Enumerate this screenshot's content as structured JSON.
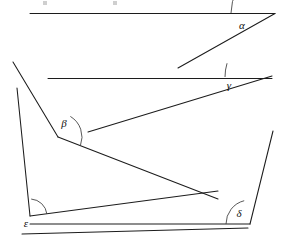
{
  "figure": {
    "width": 286,
    "height": 247,
    "background_color": "#ffffff",
    "stroke_color": "#1c1c1c",
    "arc_color": "#3a3a3a",
    "label_color": "#111111"
  },
  "angles": [
    {
      "id": "alpha",
      "label": "α",
      "label_x": 242,
      "label_y": 26,
      "vertex_x": 275,
      "vertex_y": 13,
      "arc_radius": 44,
      "arc_start_deg": 180,
      "arc_end_deg": 210,
      "kind": "acute",
      "approx_degrees": 30
    },
    {
      "id": "gamma",
      "label": "γ",
      "label_x": 229,
      "label_y": 86,
      "vertex_x": 272,
      "vertex_y": 77,
      "arc_radius": 47,
      "arc_start_deg": 180,
      "arc_end_deg": 197,
      "kind": "acute",
      "approx_degrees": 17
    },
    {
      "id": "beta",
      "label": "β",
      "label_x": 64,
      "label_y": 124,
      "vertex_x": 58,
      "vertex_y": 137,
      "arc_radius": 24,
      "arc_start_deg": 301,
      "arc_end_deg": 21,
      "kind": "obtuse",
      "approx_degrees": 140
    },
    {
      "id": "epsilon",
      "label": "ε",
      "label_x": 26,
      "label_y": 224,
      "vertex_x": 30,
      "vertex_y": 216,
      "arc_radius": 17,
      "arc_start_deg": 274,
      "arc_end_deg": 353,
      "kind": "reflex",
      "approx_degrees": 279
    },
    {
      "id": "delta",
      "label": "δ",
      "label_x": 239,
      "label_y": 214,
      "vertex_x": 250,
      "vertex_y": 224,
      "arc_radius": 24,
      "arc_start_deg": 180,
      "arc_end_deg": 256,
      "kind": "obtuse",
      "approx_degrees": 104
    }
  ],
  "segments": [
    {
      "name": "top-horizontal-line",
      "x1": 30,
      "y1": 13.5,
      "x2": 275,
      "y2": 13.5
    },
    {
      "name": "alpha-ray",
      "x1": 275,
      "y1": 13.5,
      "x2": 178,
      "y2": 68
    },
    {
      "name": "second-horizontal-line",
      "x1": 48,
      "y1": 78.5,
      "x2": 272,
      "y2": 78.5
    },
    {
      "name": "gamma-ray",
      "x1": 272,
      "y1": 76,
      "x2": 88,
      "y2": 132
    },
    {
      "name": "upper-left-diagonal",
      "x1": 13,
      "y1": 62,
      "x2": 58,
      "y2": 137
    },
    {
      "name": "left-side-line",
      "x1": 17,
      "y1": 88,
      "x2": 30,
      "y2": 216
    },
    {
      "name": "beta-lower-ray",
      "x1": 58,
      "y1": 137,
      "x2": 218,
      "y2": 199
    },
    {
      "name": "epsilon-upper-ray",
      "x1": 30,
      "y1": 216,
      "x2": 218,
      "y2": 191
    },
    {
      "name": "bottom-base-line",
      "x1": 30,
      "y1": 224,
      "x2": 250,
      "y2": 224
    },
    {
      "name": "lower-outer-line",
      "x1": 22,
      "y1": 234,
      "x2": 248,
      "y2": 228
    },
    {
      "name": "right-side-diagonal",
      "x1": 273,
      "y1": 131,
      "x2": 250,
      "y2": 224
    }
  ],
  "crop_marks": [
    {
      "name": "crop-mark-left",
      "x": 43,
      "y": 1,
      "w": 4,
      "h": 4
    },
    {
      "name": "crop-mark-right",
      "x": 113,
      "y": 1,
      "w": 4,
      "h": 4
    }
  ]
}
